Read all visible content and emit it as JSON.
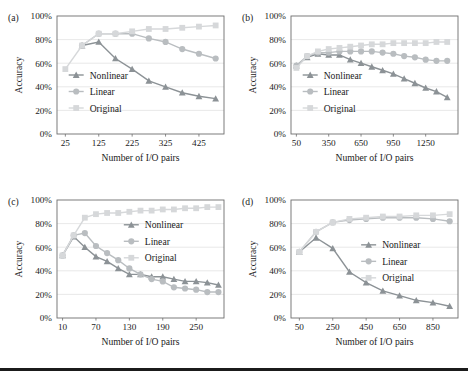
{
  "figure": {
    "background": "#ffffff",
    "rule_color": "#1b1b1b",
    "colors": {
      "nonlinear": "#8c9296",
      "linear": "#b9bdc0",
      "original": "#d6d8da",
      "axis": "#6d6d6d",
      "grid": "#e2e2e2",
      "text": "#1a1a1a"
    },
    "common": {
      "ylabel": "Accuracy",
      "xlabel": "Number of I/O pairs",
      "yticks": [
        "0%",
        "20%",
        "40%",
        "60%",
        "80%",
        "100%"
      ],
      "legend": [
        "Nonlinear",
        "Linear",
        "Original"
      ],
      "markers": {
        "nonlinear": "triangle-marker",
        "linear": "circle-marker",
        "original": "square-marker"
      }
    }
  },
  "chart_data": [
    {
      "id": "a",
      "panel_label": "(a)",
      "type": "line",
      "title": "",
      "xlabel": "Number of I/O pairs",
      "ylabel": "Accuracy",
      "xlim": [
        0,
        500
      ],
      "ylim": [
        0,
        100
      ],
      "xticks": [
        25,
        125,
        225,
        325,
        425
      ],
      "xtick_labels": [
        "25",
        "125",
        "225",
        "325",
        "425"
      ],
      "yticks": [
        0,
        20,
        40,
        60,
        80,
        100
      ],
      "ytick_labels": [
        "0%",
        "20%",
        "40%",
        "60%",
        "80%",
        "100%"
      ],
      "grid": true,
      "legend_position": "lower-left-inside",
      "x": [
        25,
        75,
        125,
        175,
        225,
        275,
        325,
        375,
        425,
        475
      ],
      "series": [
        {
          "name": "Nonlinear",
          "marker": "triangle-marker",
          "color": "#8c9296",
          "values": [
            null,
            75,
            78,
            64,
            55,
            45,
            40,
            35,
            32,
            30
          ]
        },
        {
          "name": "Linear",
          "marker": "circle-marker",
          "color": "#b9bdc0",
          "values": [
            null,
            75,
            85,
            85,
            85,
            81,
            78,
            72,
            68,
            64
          ]
        },
        {
          "name": "Original",
          "marker": "square-marker",
          "color": "#d6d8da",
          "values": [
            55,
            75,
            85,
            85,
            87,
            89,
            89,
            90,
            91,
            92
          ]
        }
      ]
    },
    {
      "id": "b",
      "panel_label": "(b)",
      "type": "line",
      "title": "",
      "xlabel": "Number of I/O pairs",
      "ylabel": "Accuracy",
      "xlim": [
        0,
        1550
      ],
      "ylim": [
        0,
        100
      ],
      "xticks": [
        50,
        350,
        650,
        950,
        1250
      ],
      "xtick_labels": [
        "50",
        "350",
        "650",
        "950",
        "1250"
      ],
      "yticks": [
        0,
        20,
        40,
        60,
        80,
        100
      ],
      "ytick_labels": [
        "0%",
        "20%",
        "40%",
        "60%",
        "80%",
        "100%"
      ],
      "grid": true,
      "legend_position": "lower-left-inside",
      "x": [
        50,
        150,
        250,
        350,
        450,
        550,
        650,
        750,
        850,
        950,
        1050,
        1150,
        1250,
        1350,
        1450
      ],
      "series": [
        {
          "name": "Nonlinear",
          "marker": "triangle-marker",
          "color": "#8c9296",
          "values": [
            58,
            65,
            68,
            67,
            67,
            63,
            60,
            57,
            54,
            51,
            47,
            43,
            39,
            36,
            31
          ]
        },
        {
          "name": "Linear",
          "marker": "circle-marker",
          "color": "#b9bdc0",
          "values": [
            58,
            66,
            69,
            69,
            70,
            70,
            70,
            70,
            69,
            68,
            66,
            65,
            63,
            62,
            62
          ]
        },
        {
          "name": "Original",
          "marker": "square-marker",
          "color": "#d6d8da",
          "values": [
            56,
            66,
            70,
            72,
            73,
            74,
            75,
            76,
            76,
            77,
            77,
            77,
            77,
            78,
            78
          ]
        }
      ]
    },
    {
      "id": "c",
      "panel_label": "(c)",
      "type": "line",
      "title": "",
      "xlabel": "Number of I/O pairs",
      "ylabel": "Accuracy",
      "xlim": [
        0,
        300
      ],
      "ylim": [
        0,
        100
      ],
      "xticks": [
        10,
        70,
        130,
        190,
        250
      ],
      "xtick_labels": [
        "10",
        "70",
        "130",
        "190",
        "250"
      ],
      "yticks": [
        0,
        20,
        40,
        60,
        80,
        100
      ],
      "ytick_labels": [
        "0%",
        "20%",
        "40%",
        "60%",
        "80%",
        "100%"
      ],
      "grid": true,
      "legend_position": "upper-right-inside",
      "x": [
        10,
        30,
        50,
        70,
        90,
        110,
        130,
        150,
        170,
        190,
        210,
        230,
        250,
        270,
        290
      ],
      "series": [
        {
          "name": "Nonlinear",
          "marker": "triangle-marker",
          "color": "#8c9296",
          "values": [
            53,
            69,
            60,
            52,
            48,
            42,
            37,
            37,
            35,
            35,
            33,
            31,
            31,
            30,
            28
          ]
        },
        {
          "name": "Linear",
          "marker": "circle-marker",
          "color": "#b9bdc0",
          "values": [
            53,
            70,
            72,
            61,
            55,
            49,
            42,
            37,
            33,
            31,
            26,
            25,
            24,
            22,
            22
          ]
        },
        {
          "name": "Original",
          "marker": "square-marker",
          "color": "#d6d8da",
          "values": [
            53,
            70,
            85,
            88,
            89,
            89,
            90,
            91,
            91,
            92,
            92,
            93,
            93,
            94,
            94
          ]
        }
      ]
    },
    {
      "id": "d",
      "panel_label": "(d)",
      "type": "line",
      "title": "",
      "xlabel": "Number of I/O pairs",
      "ylabel": "Accuracy",
      "xlim": [
        0,
        1000
      ],
      "ylim": [
        0,
        100
      ],
      "xticks": [
        50,
        250,
        450,
        650,
        850
      ],
      "xtick_labels": [
        "50",
        "250",
        "450",
        "650",
        "850"
      ],
      "yticks": [
        0,
        20,
        40,
        60,
        80,
        100
      ],
      "ytick_labels": [
        "0%",
        "20%",
        "40%",
        "60%",
        "80%",
        "100%"
      ],
      "grid": true,
      "legend_position": "middle-right-inside",
      "x": [
        50,
        150,
        250,
        350,
        450,
        550,
        650,
        750,
        850,
        950
      ],
      "series": [
        {
          "name": "Nonlinear",
          "marker": "triangle-marker",
          "color": "#8c9296",
          "values": [
            56,
            68,
            59,
            39,
            30,
            23,
            19,
            15,
            13,
            10
          ]
        },
        {
          "name": "Linear",
          "marker": "circle-marker",
          "color": "#b9bdc0",
          "values": [
            56,
            73,
            81,
            83,
            84,
            85,
            85,
            85,
            84,
            82
          ]
        },
        {
          "name": "Original",
          "marker": "square-marker",
          "color": "#d6d8da",
          "values": [
            56,
            73,
            81,
            84,
            85,
            86,
            86,
            87,
            87,
            88
          ]
        }
      ]
    }
  ]
}
